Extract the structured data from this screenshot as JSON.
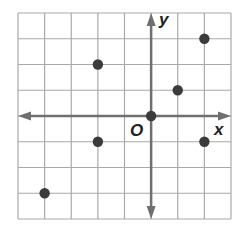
{
  "diagram": {
    "type": "coordinate-grid",
    "grid": {
      "x_min": -5,
      "x_max": 3,
      "y_min": -4,
      "y_max": 4
    },
    "axis_labels": {
      "x": "x",
      "y": "y",
      "origin": "O"
    },
    "colors": {
      "grid": "#a9a9a9",
      "axis": "#6f6f6f",
      "point": "#3b3b3b"
    }
  },
  "chart_data": {
    "type": "scatter",
    "title": "",
    "xlabel": "x",
    "ylabel": "y",
    "xlim": [
      -5,
      3
    ],
    "ylim": [
      -4,
      4
    ],
    "grid": true,
    "points": [
      {
        "x": -2,
        "y": 2
      },
      {
        "x": 2,
        "y": 3
      },
      {
        "x": 1,
        "y": 1
      },
      {
        "x": 0,
        "y": 0
      },
      {
        "x": -2,
        "y": -1
      },
      {
        "x": 2,
        "y": -1
      },
      {
        "x": -4,
        "y": -3
      }
    ]
  }
}
